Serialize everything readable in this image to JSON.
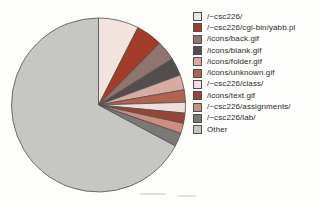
{
  "chart_data": {
    "type": "pie",
    "title": "",
    "legend_position": "right",
    "start_angle_deg": -90,
    "direction": "clockwise",
    "outline_color": "#4f4f4f",
    "background_color": "#fdfdfb",
    "labels": [
      "/~csc226/",
      "/~csc226/cgi-bin/yabb.pl",
      "/icons/back.gif",
      "/icons/blank.gif",
      "/icons/folder.gif",
      "/icons/unknown.gif",
      "/~csc226/class/",
      "/icons/text.gif",
      "/~csc226/assignments/",
      "/~csc226/lab/",
      "Other"
    ],
    "values": [
      7.5,
      4.9,
      3.7,
      3.3,
      2.8,
      2.3,
      2.0,
      1.9,
      1.9,
      2.5,
      67.2
    ],
    "unit": "percent",
    "colors": [
      "#f3e3df",
      "#a23b28",
      "#8f7470",
      "#534e4d",
      "#d6aba2",
      "#b2624f",
      "#efdeda",
      "#964537",
      "#cd8e80",
      "#7b7876",
      "#c6c7c5"
    ]
  },
  "pie_geometry": {
    "cx": 98.5,
    "cy": 105,
    "r": 87
  }
}
